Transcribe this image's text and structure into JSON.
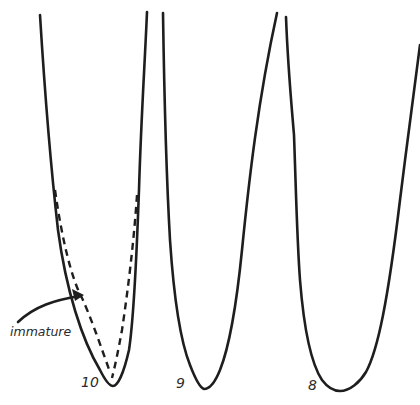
{
  "figure": {
    "teeth": [
      {
        "label": "10",
        "has_immature_outline": true
      },
      {
        "label": "9",
        "has_immature_outline": false
      },
      {
        "label": "8",
        "has_immature_outline": false
      }
    ],
    "annotation": {
      "text": "immature",
      "arrow_target": "dashed outline of tooth 10"
    },
    "colors": {
      "line": "#1e1e1e",
      "background": "#ffffff"
    }
  }
}
